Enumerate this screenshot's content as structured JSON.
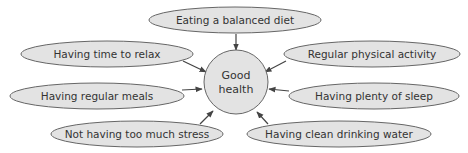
{
  "diagram": {
    "center": {
      "line1": "Good",
      "line2": "health"
    },
    "nodes": [
      {
        "label": "Eating a balanced diet"
      },
      {
        "label": "Having time to relax"
      },
      {
        "label": "Regular physical activity"
      },
      {
        "label": "Having regular meals"
      },
      {
        "label": "Having plenty of sleep"
      },
      {
        "label": "Not having too much stress"
      },
      {
        "label": "Having clean drinking water"
      }
    ],
    "colors": {
      "fill": "#e3e3e3",
      "stroke": "#666666",
      "arrow": "#444444",
      "text": "#333333"
    }
  }
}
